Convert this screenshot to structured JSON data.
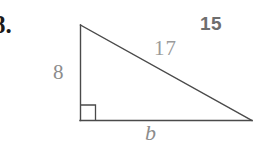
{
  "figure": {
    "problem_number": "8.",
    "answer_annotation": "15",
    "labels": {
      "vertical_leg": "8",
      "hypotenuse": "17",
      "base": "b"
    },
    "right_angle_marker": "right-angle-square",
    "colors": {
      "problem_number": "#1a1a1a",
      "answer_annotation": "#6e6e6e",
      "measure_label": "#8c8c8c",
      "hypotenuse_label": "#9a9a9a",
      "stroke": "#4a4a4a"
    },
    "geometry": {
      "apex": [
        80,
        25
      ],
      "right_angle_vertex": [
        80,
        120
      ],
      "far_vertex": [
        252,
        120
      ],
      "right_angle_box_size": 15
    }
  }
}
